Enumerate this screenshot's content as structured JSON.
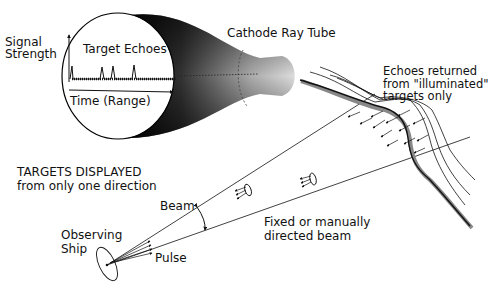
{
  "diagram": {
    "crt": {
      "title": "Cathode Ray Tube",
      "y_axis_label": "Signal\nStrength",
      "x_axis_label": "Time (Range)",
      "trace_label": "Target Echoes"
    },
    "caption_main": "TARGETS DISPLAYED",
    "caption_sub": "from only one direction",
    "beam_label": "Beam",
    "pulse_label": "Pulse",
    "ship_label_1": "Observing",
    "ship_label_2": "Ship",
    "beam_desc_1": "Fixed or manually",
    "beam_desc_2": "directed beam",
    "echoes_1": "Echoes returned",
    "echoes_2": "from \"illuminated\"",
    "echoes_3": "targets only"
  }
}
